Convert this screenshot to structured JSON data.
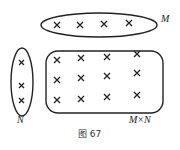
{
  "diagram": {
    "caption": "图 67",
    "sets": {
      "M": {
        "label": "M",
        "count": 4
      },
      "N": {
        "label": "N",
        "count": 3
      },
      "product": {
        "label": "M×N",
        "rows": 3,
        "cols": 4
      }
    },
    "element_glyph": "cross-mark",
    "stroke_color": "#222222"
  }
}
